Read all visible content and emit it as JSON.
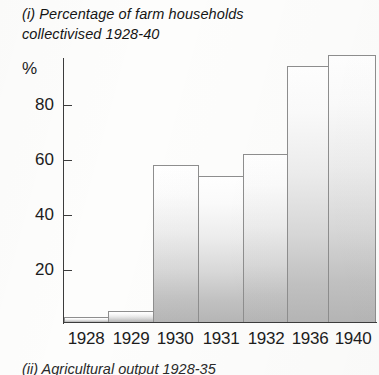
{
  "chart_data": {
    "type": "bar",
    "title": "(i) Percentage of farm households\n collectivised 1928-40",
    "xlabel": "",
    "ylabel": "%",
    "ylim": [
      0,
      100
    ],
    "yticks": [
      20,
      40,
      60,
      80
    ],
    "ytick_labels": [
      "20",
      "40",
      "60",
      "80"
    ],
    "grid": false,
    "legend": "none",
    "categories": [
      "1928",
      "1929",
      "1930",
      "1931",
      "1932",
      "1936",
      "1940"
    ],
    "values": [
      1.7,
      3.9,
      57,
      53,
      61,
      93,
      97
    ],
    "bar_style": "vertical-gradient-white-to-grey",
    "axis_color": "#3c3c3c",
    "bar_border_color": "#8e8e8e"
  },
  "footer": {
    "next_caption": "(ii) Agricultural output 1928-35"
  }
}
